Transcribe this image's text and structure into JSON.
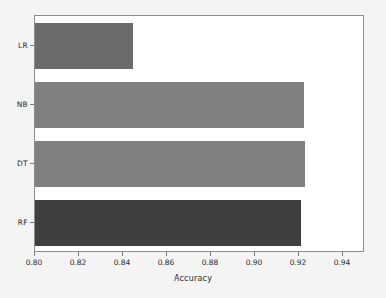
{
  "chart_data": {
    "type": "bar",
    "orientation": "horizontal",
    "title": "",
    "xlabel": "Accuracy",
    "ylabel": "",
    "categories": [
      "LR",
      "NB",
      "DT",
      "RF"
    ],
    "values": [
      0.8445,
      0.9222,
      0.9226,
      0.9207
    ],
    "xlim": [
      0.8,
      0.95
    ],
    "xticks": [
      "0.80",
      "0.82",
      "0.84",
      "0.86",
      "0.88",
      "0.90",
      "0.92",
      "0.94"
    ],
    "xtick_values": [
      0.8,
      0.82,
      0.84,
      0.86,
      0.88,
      0.9,
      0.92,
      0.94
    ],
    "grid": false,
    "legend": "none",
    "bar_colors": [
      "#6b6b6b",
      "#808080",
      "#808080",
      "#3f3f3f"
    ],
    "series": [
      {
        "name": "Accuracy",
        "points": [
          {
            "category": "LR",
            "value": 0.8445,
            "color": "#6b6b6b"
          },
          {
            "category": "NB",
            "value": 0.9222,
            "color": "#808080"
          },
          {
            "category": "DT",
            "value": 0.9226,
            "color": "#808080"
          },
          {
            "category": "RF",
            "value": 0.9207,
            "color": "#3f3f3f"
          }
        ]
      }
    ]
  },
  "figure": {
    "background_color": "#f4f4f4",
    "plot_background_color": "#ffffff",
    "axis_color": "#8d8d8d"
  }
}
